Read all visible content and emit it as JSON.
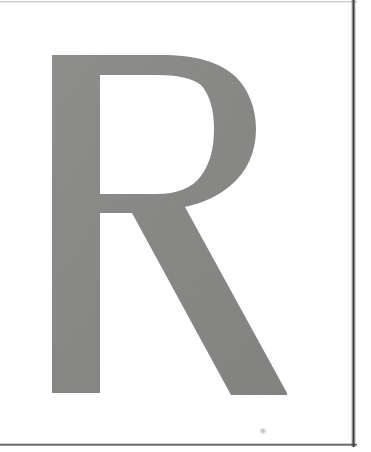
{
  "page": {
    "kind": "scanned-page",
    "width": 371,
    "height": 452,
    "background_color": "#ffffff",
    "caption": "Scanned page showing a single large capital letter"
  },
  "glyph": {
    "character": "R",
    "name": "letter-r",
    "label": "R",
    "ink_color": "#8a8a8a",
    "ink_color_dark": "#7e7e7e",
    "ink_color_light": "#9a9a9a",
    "style": "capital, high-contrast serif-less roman",
    "bounds": {
      "left": 52,
      "top": 55,
      "right": 287,
      "bottom": 395,
      "width": 235,
      "height": 340
    },
    "parts": {
      "stem": "vertical left stem",
      "bowl": "upper closed bowl",
      "counter": "white counter inside bowl",
      "leg": "diagonal descending leg"
    }
  },
  "artifacts": {
    "top_rule": {
      "name": "top-scan-rule",
      "color": "#78787a",
      "y": 1
    },
    "right_rule": {
      "name": "right-scan-rule",
      "color": "#222226",
      "x": 353
    },
    "bottom_rule": {
      "name": "bottom-scan-rule",
      "color": "#2a2a2e",
      "y": 444
    },
    "speck": {
      "name": "dust-speck",
      "color": "#969698",
      "x": 261,
      "y": 429
    }
  }
}
